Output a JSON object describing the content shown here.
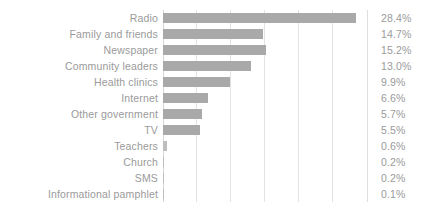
{
  "chart_data": {
    "type": "bar",
    "orientation": "horizontal",
    "title": "",
    "subtitle": "",
    "xlabel": "",
    "ylabel": "",
    "xlim": [
      0,
      30
    ],
    "grid": true,
    "gridlines": [
      5,
      10,
      15,
      20,
      25,
      30
    ],
    "legend": "none",
    "value_suffix": "%",
    "bar_color": "#a9a9a9",
    "text_color": "#9a9a9a",
    "gridline_color": "#e3e3e3",
    "categories": [
      "Radio",
      "Family and friends",
      "Newspaper",
      "Community leaders",
      "Health clinics",
      "Internet",
      "Other government",
      "TV",
      "Teachers",
      "Church",
      "SMS",
      "Informational pamphlet"
    ],
    "values": [
      28.4,
      14.7,
      15.2,
      13.0,
      9.9,
      6.6,
      5.7,
      5.5,
      0.6,
      0.2,
      0.2,
      0.1
    ],
    "value_labels": [
      "28.4%",
      "14.7%",
      "15.2%",
      "13.0%",
      "9.9%",
      "6.6%",
      "5.7%",
      "5.5%",
      "0.6%",
      "0.2%",
      "0.2%",
      "0.1%"
    ]
  }
}
